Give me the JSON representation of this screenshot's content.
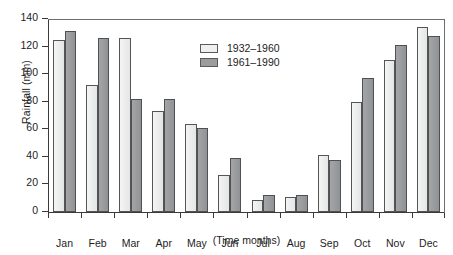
{
  "axes": {
    "ylabel": "Rainfall (mm)",
    "xcaption": "(Time months)",
    "yticks": [
      "0",
      "20",
      "40",
      "60",
      "80",
      "100",
      "120",
      "140"
    ]
  },
  "legend": {
    "items": [
      {
        "label": "1932–1960",
        "color": "#eef0ef"
      },
      {
        "label": "1961–1990",
        "color": "#9a9c9e"
      }
    ]
  },
  "chart_data": {
    "type": "bar",
    "title": "",
    "xlabel": "(Time months)",
    "ylabel": "Rainfall (mm)",
    "ylim": [
      0,
      140
    ],
    "ytick_step": 20,
    "grid": false,
    "legend_position": "upper-center-left-inside",
    "categories": [
      "Jan",
      "Feb",
      "Mar",
      "Apr",
      "May",
      "Jun",
      "Jul",
      "Aug",
      "Sep",
      "Oct",
      "Nov",
      "Dec"
    ],
    "series": [
      {
        "name": "1932–1960",
        "color": "#eef0ef",
        "values": [
          125,
          92,
          126,
          73,
          64,
          27,
          9,
          11,
          41,
          80,
          110,
          134
        ]
      },
      {
        "name": "1961–1990",
        "color": "#9a9c9e",
        "values": [
          131,
          126,
          82,
          82,
          61,
          39,
          12,
          12,
          38,
          97,
          121,
          128
        ]
      }
    ]
  }
}
